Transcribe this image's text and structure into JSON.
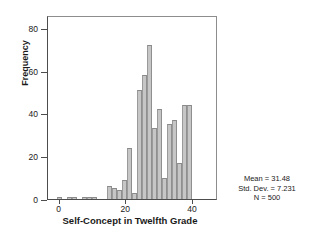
{
  "chart_data": {
    "type": "bar",
    "title": "",
    "xlabel": "Self-Concept in Twelfth Grade",
    "ylabel": "Frequency",
    "grid": false,
    "legend": null,
    "xlim": [
      -3.5,
      47.5
    ],
    "ylim": [
      0,
      86
    ],
    "xticks": [
      0,
      20,
      40
    ],
    "yticks": [
      0,
      20,
      40,
      60,
      80
    ],
    "bin_width": 1.5,
    "categories": [
      0,
      1.5,
      3,
      4.5,
      6,
      7.5,
      9,
      10.5,
      12,
      13.5,
      15,
      16.5,
      18,
      19.5,
      21,
      22.5,
      24,
      25.5,
      27,
      28.5,
      30,
      31.5,
      33,
      34.5,
      36,
      37.5,
      39,
      40.5,
      42
    ],
    "values": [
      1,
      0,
      1,
      1,
      0,
      1,
      1,
      1,
      0,
      0,
      6,
      5,
      4,
      9,
      24,
      3,
      51,
      58,
      72,
      33,
      42,
      10,
      35,
      37,
      17,
      44,
      44,
      0,
      0
    ]
  },
  "axes": {
    "y": {
      "label": "Frequency",
      "ticks": [
        "0",
        "20",
        "40",
        "60",
        "80"
      ]
    },
    "x": {
      "label": "Self-Concept in Twelfth Grade",
      "ticks": [
        "0",
        "20",
        "40"
      ]
    }
  },
  "annotation": {
    "mean": "Mean = 31.48",
    "std_dev": "Std. Dev. = 7.231",
    "n": "N = 500"
  },
  "colors": {
    "bar_fill": "#c6c6c6",
    "bar_edge": "#8f8f8f",
    "axis": "#4d4d4d",
    "text": "#1a1a1a"
  }
}
